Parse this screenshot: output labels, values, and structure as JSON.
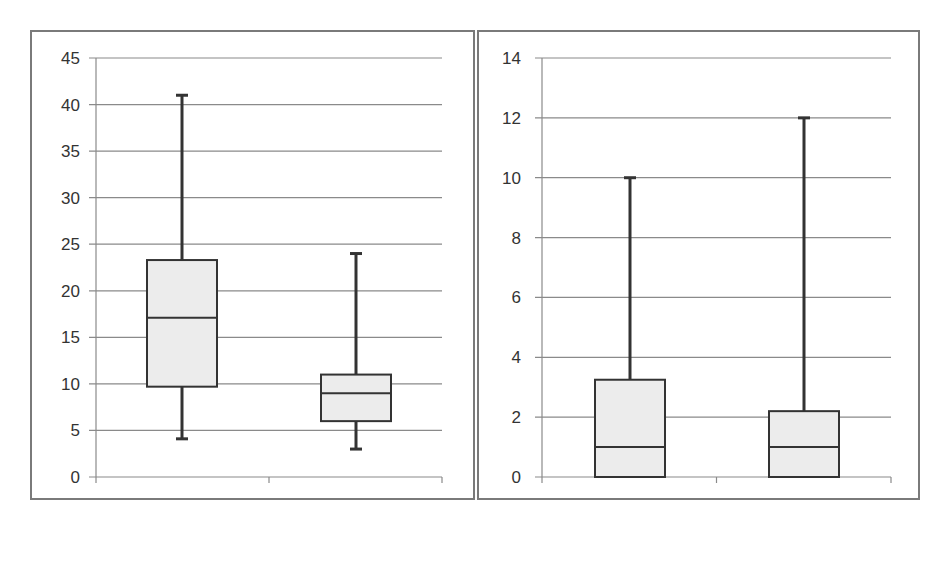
{
  "chart_data": [
    {
      "type": "box",
      "title": "",
      "xlabel": "",
      "ylabel": "",
      "categories": [
        "Teapot",
        "Face"
      ],
      "ylim": [
        0,
        45
      ],
      "yticks": [
        0,
        5,
        10,
        15,
        20,
        25,
        30,
        35,
        40,
        45
      ],
      "grid": true,
      "legend": null,
      "boxes": [
        {
          "category": "Teapot",
          "min": 4.1,
          "q1": 9.7,
          "median": 17.1,
          "q3": 23.3,
          "max": 41.0
        },
        {
          "category": "Face",
          "min": 3.0,
          "q1": 6.0,
          "median": 9.0,
          "q3": 11.0,
          "max": 24.0
        }
      ]
    },
    {
      "type": "box",
      "title": "",
      "xlabel": "",
      "ylabel": "",
      "categories": [
        "Teapot",
        "Face"
      ],
      "ylim": [
        0,
        14
      ],
      "yticks": [
        0,
        2,
        4,
        6,
        8,
        10,
        12,
        14
      ],
      "grid": true,
      "legend": null,
      "boxes": [
        {
          "category": "Teapot",
          "min": 0.0,
          "q1": 0.0,
          "median": 1.0,
          "q3": 3.25,
          "max": 10.0
        },
        {
          "category": "Face",
          "min": 0.0,
          "q1": 0.0,
          "median": 1.0,
          "q3": 2.2,
          "max": 12.0
        }
      ]
    }
  ],
  "colors": {
    "box_fill": "#ececec",
    "box_stroke": "#333333",
    "whisker": "#333333",
    "gridline": "#8a8a8a",
    "panel_border": "#7a7a7a",
    "text": "#333333"
  }
}
